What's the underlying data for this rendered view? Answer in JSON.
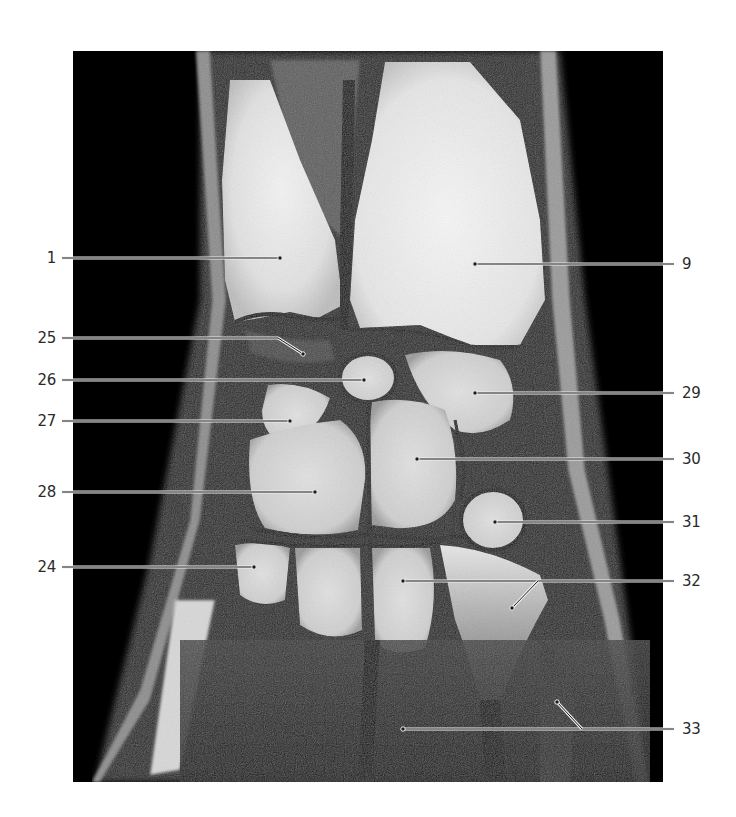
{
  "figure": {
    "image_frame": {
      "x": 73,
      "y": 51,
      "width": 590,
      "height": 731
    },
    "colors": {
      "background": "#ffffff",
      "scan_background": "#000000",
      "label_text": "#2b2b2b",
      "leader_line": "#f0f0f0",
      "leader_core": "#1a1a1a"
    }
  },
  "labels_left": [
    {
      "id": "label-1",
      "text": "1",
      "y": 258,
      "target": [
        280,
        258
      ],
      "bend": null
    },
    {
      "id": "label-25",
      "text": "25",
      "y": 338,
      "target": [
        303,
        354
      ],
      "bend": [
        278,
        338
      ]
    },
    {
      "id": "label-26",
      "text": "26",
      "y": 380,
      "target": [
        364,
        380
      ],
      "bend": null
    },
    {
      "id": "label-27",
      "text": "27",
      "y": 421,
      "target": [
        290,
        421
      ],
      "bend": null
    },
    {
      "id": "label-28",
      "text": "28",
      "y": 492,
      "target": [
        315,
        492
      ],
      "bend": null
    },
    {
      "id": "label-24",
      "text": "24",
      "y": 567,
      "target": [
        254,
        567
      ],
      "bend": null
    }
  ],
  "labels_right": [
    {
      "id": "label-9",
      "text": "9",
      "y": 264,
      "target": [
        475,
        264
      ],
      "branch": null
    },
    {
      "id": "label-29",
      "text": "29",
      "y": 393,
      "target": [
        475,
        393
      ],
      "branch": null
    },
    {
      "id": "label-30",
      "text": "30",
      "y": 459,
      "target": [
        417,
        459
      ],
      "branch": null
    },
    {
      "id": "label-31",
      "text": "31",
      "y": 522,
      "target": [
        495,
        522
      ],
      "branch": null
    },
    {
      "id": "label-32",
      "text": "32",
      "y": 581,
      "target": [
        403,
        581
      ],
      "branch": {
        "from": [
          538,
          581
        ],
        "to": [
          512,
          608
        ]
      }
    },
    {
      "id": "label-33",
      "text": "33",
      "y": 729,
      "target": [
        403,
        729
      ],
      "branch": {
        "from": [
          582,
          729
        ],
        "to": [
          557,
          702
        ]
      }
    }
  ]
}
